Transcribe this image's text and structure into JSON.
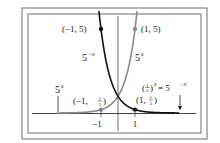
{
  "chart_data": {
    "type": "line",
    "title": "",
    "xlabel": "",
    "ylabel": "",
    "xlim": [
      -5,
      5
    ],
    "ylim": [
      0,
      5.8
    ],
    "grid": false,
    "x_ticks": [
      {
        "value": -1,
        "label": "−1"
      },
      {
        "value": 1,
        "label": "1"
      }
    ],
    "series": [
      {
        "name": "5^x",
        "formula": "y = 5^x",
        "color": "#8a8a8a",
        "x": [
          -4,
          -3,
          -2,
          -1,
          0,
          1,
          1.1
        ],
        "y": [
          0.0016,
          0.008,
          0.04,
          0.2,
          1,
          5,
          5.87
        ]
      },
      {
        "name": "5^-x",
        "formula": "y = 5^(-x) = (1/5)^x",
        "color": "#111111",
        "x": [
          -1.1,
          -1,
          0,
          1,
          2,
          3,
          4
        ],
        "y": [
          5.87,
          5,
          1,
          0.2,
          0.04,
          0.008,
          0.0016
        ]
      }
    ],
    "points": [
      {
        "label": "(−1, 5)",
        "x": -1,
        "y": 5,
        "series": "5^-x"
      },
      {
        "label": "(1, 5)",
        "x": 1,
        "y": 5,
        "series": "5^x"
      },
      {
        "label": "(−1, ⅕)",
        "x": -1,
        "y": 0.2,
        "series": "5^x"
      },
      {
        "label": "(1, ⅕)",
        "x": 1,
        "y": 0.2,
        "series": "5^-x"
      }
    ],
    "annotations": [
      {
        "text": "5^−x",
        "near": "left branch of 5^-x curve"
      },
      {
        "text": "5^x",
        "near": "right branch of 5^x curve"
      },
      {
        "text": "5^x",
        "near": "left tail, with arrow pointing down to curve"
      },
      {
        "text": "(⅕)^x = 5^−x",
        "near": "right tail, with arrow pointing down to curve"
      }
    ]
  },
  "labels": {
    "pt_m1_5": "(−1, 5)",
    "pt_1_5": "(1, 5)",
    "pt_m1_fifth_open": "(−1, ",
    "pt_1_fifth_open": "(1, ",
    "fifth_num": "1",
    "fifth_den": "5",
    "close_paren": ")",
    "curve_neg_base": "5",
    "curve_neg_exp": "−x",
    "curve_pos_base": "5",
    "curve_pos_exp": "x",
    "left_tail_base": "5",
    "left_tail_exp": "x",
    "right_tail_lhs_open": "(",
    "right_tail_lhs_close": ")",
    "right_tail_lhs_exp": "x",
    "right_tail_eq": " = 5",
    "right_tail_rhs_exp": "−x",
    "tick_m1": "−1",
    "tick_1": "1"
  },
  "colors": {
    "frame": "#6e6e6e",
    "axis": "#444444",
    "curve_pos": "#8a8a8a",
    "curve_neg": "#111111"
  }
}
